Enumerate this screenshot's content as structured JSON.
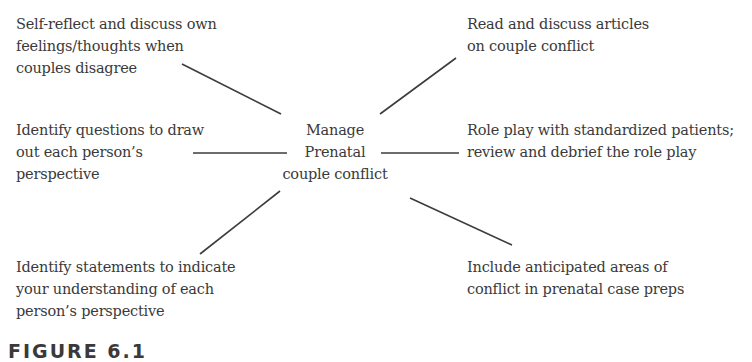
{
  "diagram": {
    "type": "mind-map",
    "center": {
      "label": "Manage\nPrenatal\ncouple conflict"
    },
    "nodes": [
      {
        "id": "top-left",
        "label": "Self-reflect and discuss own\nfeelings/thoughts when\ncouples disagree"
      },
      {
        "id": "top-right",
        "label": "Read and discuss articles\non couple conflict"
      },
      {
        "id": "mid-left",
        "label": "Identify questions to draw\nout each person’s\nperspective"
      },
      {
        "id": "mid-right",
        "label": "Role play with standardized patients;\nreview and debrief the role play"
      },
      {
        "id": "bottom-left",
        "label": "Identify statements to indicate\nyour understanding of each\nperson’s perspective"
      },
      {
        "id": "bottom-right",
        "label": "Include anticipated areas of\nconflict in prenatal case preps"
      }
    ],
    "edges": [
      {
        "from": "center",
        "to": "top-left"
      },
      {
        "from": "center",
        "to": "top-right"
      },
      {
        "from": "center",
        "to": "mid-left"
      },
      {
        "from": "center",
        "to": "mid-right"
      },
      {
        "from": "center",
        "to": "bottom-left"
      },
      {
        "from": "center",
        "to": "bottom-right"
      }
    ],
    "caption": "FIGURE 6.1"
  },
  "colors": {
    "text": "#3a3a3a",
    "line": "#3c3c3c",
    "background": "#ffffff"
  }
}
